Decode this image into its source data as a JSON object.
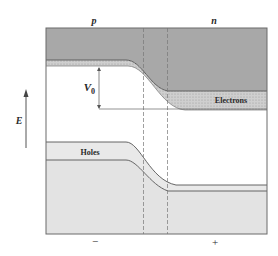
{
  "diagram": {
    "type": "pn-junction-energy-band",
    "region_labels": {
      "left": "p",
      "right": "n"
    },
    "band_labels": {
      "electrons": "Electrons",
      "holes": "Holes"
    },
    "potential_label": {
      "main": "V",
      "subscript": "0"
    },
    "axis_label": "E",
    "charge_labels": {
      "left": "−",
      "right": "+"
    },
    "colors": {
      "conduction_fill": "#a9a9a9",
      "electron_band_fill": "#c8c8c8",
      "hole_band_fill": "#e6e6e6",
      "valence_fill": "#e2e2e2",
      "lines": "#555555",
      "frame": "#6a6a6a"
    }
  }
}
